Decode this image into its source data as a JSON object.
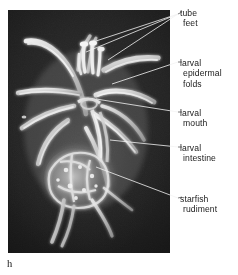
{
  "figure": {
    "letter": "h",
    "caption_letter_name": "figure-panel-letter",
    "image_kind": "light micrograph of a starfish (sea star) larva"
  },
  "colors": {
    "page_background": "#ffffff",
    "photo_dark": "#1d1d1d",
    "photo_mid": "#2f2f2f",
    "specimen_light": "#e8e8e8",
    "leader_line_on_photo": "#f2f2f2",
    "leader_line_on_page": "#5a5a5a",
    "text": "#1a1a1a"
  },
  "labels": [
    {
      "id": "tube-feet",
      "lines": [
        "tube",
        "feet"
      ],
      "line1": "tube",
      "line2": "feet",
      "leader_count": 3
    },
    {
      "id": "larval-epidermal-folds",
      "lines": [
        "larval",
        "epidermal",
        "folds"
      ],
      "line1": "larval",
      "line2": "epidermal",
      "line3": "folds",
      "leader_count": 1
    },
    {
      "id": "larval-mouth",
      "lines": [
        "larval",
        "mouth"
      ],
      "line1": "larval",
      "line2": "mouth",
      "leader_count": 1
    },
    {
      "id": "larval-intestine",
      "lines": [
        "larval",
        "intestine"
      ],
      "line1": "larval",
      "line2": "intestine",
      "leader_count": 1
    },
    {
      "id": "starfish-rudiment",
      "lines": [
        "starfish",
        "rudiment"
      ],
      "line1": "starfish",
      "line2": "rudiment",
      "leader_count": 1
    }
  ]
}
